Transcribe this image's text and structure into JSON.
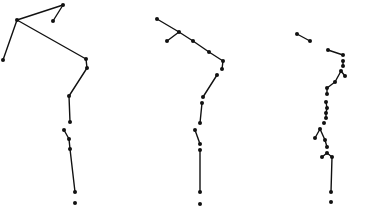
{
  "diagram": {
    "type": "stick-figure-poses",
    "background": "#ffffff",
    "ink_color": "#111111",
    "figures": [
      {
        "id": "figure-1",
        "points": [
          [
            63,
            5
          ],
          [
            53,
            21
          ],
          [
            17,
            20
          ],
          [
            3,
            60
          ],
          [
            86,
            59
          ],
          [
            87,
            68
          ],
          [
            69,
            96
          ],
          [
            70,
            122
          ],
          [
            64,
            130
          ],
          [
            69,
            139
          ],
          [
            70,
            149
          ],
          [
            75,
            192
          ],
          [
            75,
            203
          ]
        ],
        "segments": [
          [
            0,
            1
          ],
          [
            0,
            2
          ],
          [
            2,
            3
          ],
          [
            2,
            4
          ],
          [
            4,
            5
          ],
          [
            5,
            6
          ],
          [
            6,
            7
          ],
          [
            8,
            9
          ],
          [
            9,
            10
          ],
          [
            10,
            11
          ]
        ]
      },
      {
        "id": "figure-2",
        "points": [
          [
            157,
            19
          ],
          [
            179,
            32
          ],
          [
            167,
            41
          ],
          [
            193,
            41
          ],
          [
            209,
            52
          ],
          [
            223,
            61
          ],
          [
            222,
            69
          ],
          [
            217,
            75
          ],
          [
            203,
            97
          ],
          [
            202,
            103
          ],
          [
            200,
            123
          ],
          [
            195,
            130
          ],
          [
            200,
            144
          ],
          [
            200,
            150
          ],
          [
            200,
            192
          ],
          [
            200,
            204
          ]
        ],
        "segments": [
          [
            0,
            1
          ],
          [
            1,
            2
          ],
          [
            1,
            3
          ],
          [
            3,
            4
          ],
          [
            4,
            5
          ],
          [
            5,
            6
          ],
          [
            7,
            8
          ],
          [
            9,
            10
          ],
          [
            11,
            12
          ],
          [
            13,
            14
          ]
        ]
      },
      {
        "id": "figure-3",
        "points": [
          [
            297,
            34
          ],
          [
            310,
            41
          ],
          [
            328,
            50
          ],
          [
            343,
            55
          ],
          [
            343,
            61
          ],
          [
            343,
            66
          ],
          [
            341,
            71
          ],
          [
            345,
            76
          ],
          [
            335,
            82
          ],
          [
            327,
            88
          ],
          [
            327,
            94
          ],
          [
            326,
            102
          ],
          [
            327,
            108
          ],
          [
            326,
            113
          ],
          [
            326,
            118
          ],
          [
            324,
            123
          ],
          [
            320,
            129
          ],
          [
            315,
            138
          ],
          [
            325,
            140
          ],
          [
            327,
            147
          ],
          [
            327,
            153
          ],
          [
            322,
            157
          ],
          [
            332,
            157
          ],
          [
            331,
            192
          ],
          [
            331,
            202
          ]
        ],
        "segments": [
          [
            0,
            1
          ],
          [
            2,
            3
          ],
          [
            4,
            5
          ],
          [
            6,
            7
          ],
          [
            6,
            8
          ],
          [
            8,
            9
          ],
          [
            9,
            10
          ],
          [
            11,
            12
          ],
          [
            12,
            13
          ],
          [
            13,
            14
          ],
          [
            16,
            17
          ],
          [
            16,
            18
          ],
          [
            18,
            19
          ],
          [
            20,
            21
          ],
          [
            20,
            22
          ],
          [
            22,
            23
          ]
        ]
      }
    ]
  }
}
